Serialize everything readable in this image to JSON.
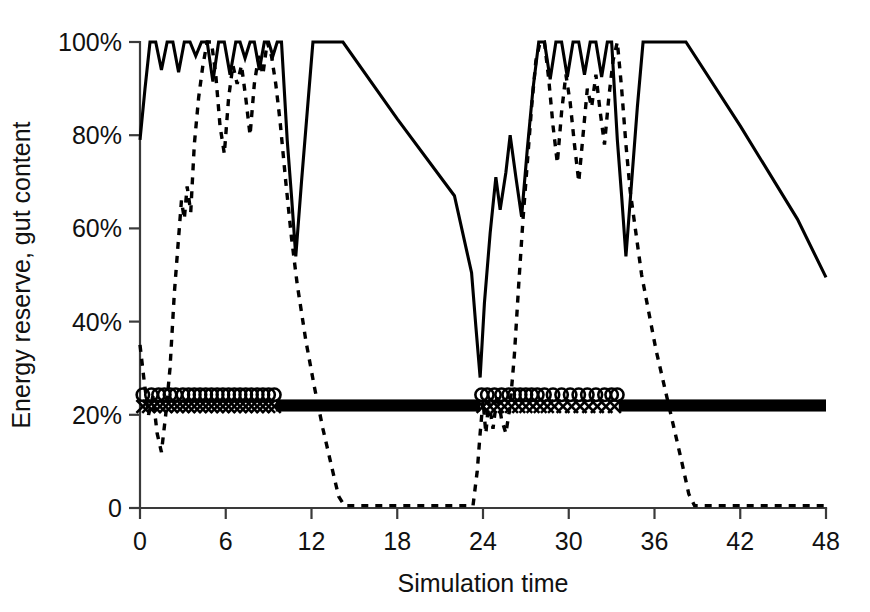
{
  "chart_data": {
    "type": "line",
    "title": "",
    "xlabel": "Simulation time",
    "ylabel": "Energy reserve, gut content",
    "xlim": [
      0,
      48
    ],
    "ylim": [
      0,
      100
    ],
    "grid": false,
    "legend_position": "none",
    "x_ticks": [
      0,
      6,
      12,
      18,
      24,
      30,
      36,
      42,
      48
    ],
    "x_tick_labels": [
      "0",
      "6",
      "12",
      "18",
      "24",
      "30",
      "36",
      "42",
      "48"
    ],
    "y_ticks": [
      0,
      20,
      40,
      60,
      80,
      100
    ],
    "y_tick_labels": [
      "0",
      "20%",
      "40%",
      "60%",
      "80%",
      "100%"
    ],
    "series": [
      {
        "name": "energy-reserve-solid",
        "style": "solid",
        "points": [
          [
            0.0,
            79.0
          ],
          [
            0.35,
            90.0
          ],
          [
            0.7,
            100.0
          ],
          [
            1.1,
            100.0
          ],
          [
            1.5,
            94.0
          ],
          [
            1.9,
            100.0
          ],
          [
            2.3,
            100.0
          ],
          [
            2.7,
            93.5
          ],
          [
            3.1,
            100.0
          ],
          [
            3.5,
            100.0
          ],
          [
            3.9,
            97.0
          ],
          [
            4.3,
            100.0
          ],
          [
            4.7,
            100.0
          ],
          [
            5.1,
            91.5
          ],
          [
            5.5,
            100.0
          ],
          [
            5.9,
            100.0
          ],
          [
            6.3,
            93.0
          ],
          [
            6.7,
            100.0
          ],
          [
            7.0,
            100.0
          ],
          [
            7.35,
            96.5
          ],
          [
            7.7,
            100.0
          ],
          [
            8.0,
            100.0
          ],
          [
            8.35,
            94.0
          ],
          [
            8.7,
            100.0
          ],
          [
            9.0,
            100.0
          ],
          [
            9.3,
            97.0
          ],
          [
            9.6,
            100.0
          ],
          [
            9.9,
            100.0
          ],
          [
            10.3,
            79.0
          ],
          [
            10.6,
            67.0
          ],
          [
            10.9,
            54.0
          ],
          [
            11.3,
            70.0
          ],
          [
            11.7,
            85.0
          ],
          [
            12.1,
            100.0
          ],
          [
            12.6,
            100.0
          ],
          [
            14.2,
            100.0
          ],
          [
            18.0,
            83.5
          ],
          [
            22.0,
            67.0
          ],
          [
            23.2,
            50.5
          ],
          [
            23.5,
            39.0
          ],
          [
            23.8,
            28.0
          ],
          [
            24.1,
            44.0
          ],
          [
            24.5,
            59.0
          ],
          [
            24.9,
            71.0
          ],
          [
            25.2,
            64.0
          ],
          [
            25.6,
            72.0
          ],
          [
            25.9,
            80.0
          ],
          [
            26.3,
            71.0
          ],
          [
            26.7,
            62.5
          ],
          [
            27.1,
            77.0
          ],
          [
            27.5,
            90.0
          ],
          [
            27.9,
            100.0
          ],
          [
            28.3,
            100.0
          ],
          [
            28.7,
            92.0
          ],
          [
            29.1,
            100.0
          ],
          [
            29.5,
            100.0
          ],
          [
            29.9,
            92.5
          ],
          [
            30.3,
            100.0
          ],
          [
            30.7,
            100.0
          ],
          [
            31.1,
            93.0
          ],
          [
            31.5,
            100.0
          ],
          [
            31.9,
            100.0
          ],
          [
            32.3,
            92.5
          ],
          [
            32.7,
            100.0
          ],
          [
            33.0,
            100.0
          ],
          [
            33.4,
            79.0
          ],
          [
            33.7,
            67.0
          ],
          [
            34.0,
            54.0
          ],
          [
            34.4,
            70.0
          ],
          [
            34.8,
            86.0
          ],
          [
            35.2,
            100.0
          ],
          [
            36.0,
            100.0
          ],
          [
            38.2,
            100.0
          ],
          [
            42.0,
            82.0
          ],
          [
            46.0,
            62.0
          ],
          [
            48.0,
            49.5
          ]
        ]
      },
      {
        "name": "gut-content-dashed",
        "style": "dashed",
        "points": [
          [
            0.0,
            35.0
          ],
          [
            0.3,
            27.0
          ],
          [
            0.6,
            20.0
          ],
          [
            0.9,
            24.0
          ],
          [
            1.2,
            16.0
          ],
          [
            1.5,
            12.0
          ],
          [
            1.8,
            20.0
          ],
          [
            2.1,
            30.0
          ],
          [
            2.4,
            46.0
          ],
          [
            2.7,
            58.0
          ],
          [
            2.9,
            66.0
          ],
          [
            3.1,
            62.0
          ],
          [
            3.3,
            69.0
          ],
          [
            3.55,
            63.5
          ],
          [
            3.8,
            78.0
          ],
          [
            4.1,
            88.0
          ],
          [
            4.4,
            95.0
          ],
          [
            4.7,
            100.0
          ],
          [
            5.0,
            100.0
          ],
          [
            5.3,
            93.0
          ],
          [
            5.6,
            82.0
          ],
          [
            5.9,
            76.0
          ],
          [
            6.2,
            88.0
          ],
          [
            6.5,
            95.0
          ],
          [
            6.8,
            91.0
          ],
          [
            7.1,
            95.0
          ],
          [
            7.4,
            88.0
          ],
          [
            7.7,
            80.0
          ],
          [
            8.0,
            91.0
          ],
          [
            8.3,
            97.0
          ],
          [
            8.6,
            93.0
          ],
          [
            8.9,
            100.0
          ],
          [
            9.2,
            97.0
          ],
          [
            9.5,
            91.0
          ],
          [
            9.8,
            83.0
          ],
          [
            10.2,
            70.0
          ],
          [
            10.6,
            58.0
          ],
          [
            11.0,
            48.0
          ],
          [
            11.6,
            36.0
          ],
          [
            12.2,
            26.0
          ],
          [
            12.8,
            17.0
          ],
          [
            13.4,
            9.0
          ],
          [
            13.9,
            2.5
          ],
          [
            14.3,
            0.5
          ],
          [
            15.0,
            0.5
          ],
          [
            20.0,
            0.5
          ],
          [
            23.3,
            0.5
          ],
          [
            23.6,
            8.0
          ],
          [
            23.8,
            16.0
          ],
          [
            24.0,
            23.0
          ],
          [
            24.2,
            16.0
          ],
          [
            24.4,
            23.0
          ],
          [
            24.7,
            17.0
          ],
          [
            25.0,
            24.5
          ],
          [
            25.3,
            19.0
          ],
          [
            25.6,
            16.0
          ],
          [
            25.9,
            22.0
          ],
          [
            26.2,
            33.0
          ],
          [
            26.5,
            48.0
          ],
          [
            26.8,
            62.0
          ],
          [
            27.1,
            74.0
          ],
          [
            27.4,
            86.0
          ],
          [
            27.7,
            96.0
          ],
          [
            28.0,
            100.0
          ],
          [
            28.3,
            100.0
          ],
          [
            28.6,
            92.0
          ],
          [
            28.9,
            82.0
          ],
          [
            29.2,
            74.0
          ],
          [
            29.5,
            85.0
          ],
          [
            29.8,
            93.0
          ],
          [
            30.1,
            87.0
          ],
          [
            30.4,
            78.0
          ],
          [
            30.7,
            70.0
          ],
          [
            31.0,
            80.0
          ],
          [
            31.3,
            90.0
          ],
          [
            31.6,
            86.0
          ],
          [
            31.9,
            93.0
          ],
          [
            32.2,
            85.0
          ],
          [
            32.5,
            78.0
          ],
          [
            32.8,
            88.0
          ],
          [
            33.1,
            96.0
          ],
          [
            33.4,
            100.0
          ],
          [
            33.7,
            90.0
          ],
          [
            34.0,
            78.0
          ],
          [
            34.3,
            68.0
          ],
          [
            34.7,
            59.0
          ],
          [
            35.1,
            50.0
          ],
          [
            35.6,
            42.0
          ],
          [
            36.1,
            34.0
          ],
          [
            36.7,
            26.0
          ],
          [
            37.3,
            18.0
          ],
          [
            37.9,
            10.0
          ],
          [
            38.4,
            3.0
          ],
          [
            38.8,
            0.5
          ],
          [
            40.0,
            0.5
          ],
          [
            44.0,
            0.5
          ],
          [
            48.0,
            0.5
          ]
        ]
      }
    ],
    "markers": {
      "circle_series": {
        "name": "circle-markers",
        "symbol": "circle",
        "y_level": 24.3,
        "x_values": [
          0.2,
          0.8,
          1.3,
          1.7,
          2.1,
          2.5,
          3.0,
          3.4,
          3.8,
          4.2,
          4.6,
          5.0,
          5.4,
          5.8,
          6.2,
          6.6,
          7.0,
          7.4,
          7.8,
          8.2,
          8.6,
          9.0,
          9.4,
          23.9,
          24.3,
          24.8,
          25.3,
          25.8,
          26.2,
          26.6,
          27.0,
          27.4,
          27.8,
          28.3,
          28.9,
          29.5,
          30.1,
          30.7,
          31.3,
          31.9,
          32.5,
          33.0,
          33.4
        ]
      },
      "x_series": {
        "name": "x-markers",
        "symbol": "x",
        "y_level": 21.8,
        "x_values": [
          0.2,
          0.6,
          1.0,
          1.4,
          1.8,
          2.2,
          2.6,
          3.0,
          3.4,
          3.8,
          4.2,
          4.6,
          5.0,
          5.4,
          5.8,
          6.2,
          6.6,
          7.0,
          7.4,
          7.8,
          8.2,
          8.6,
          9.0,
          9.4,
          24.0,
          24.5,
          25.0,
          25.5,
          26.0,
          26.5,
          27.0,
          27.5,
          28.0,
          28.5,
          29.0,
          29.6,
          30.2,
          30.8,
          31.4,
          32.0,
          32.6,
          33.2
        ]
      }
    },
    "bars": {
      "name": "night-period-bars",
      "y_level": 20.7,
      "height_pct": 2.6,
      "ranges": [
        [
          9.5,
          23.8
        ],
        [
          33.5,
          48.0
        ]
      ]
    }
  }
}
